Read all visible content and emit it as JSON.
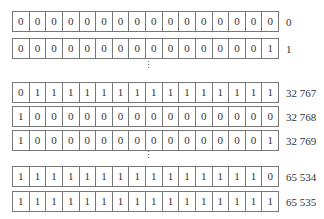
{
  "rows": [
    {
      "bits": [
        "0",
        "0",
        "0",
        "0",
        "0",
        "0",
        "0",
        "0",
        "0",
        "0",
        "0",
        "0",
        "0",
        "0",
        "0",
        "0"
      ],
      "value": "0"
    },
    {
      "bits": [
        "0",
        "0",
        "0",
        "0",
        "0",
        "0",
        "0",
        "0",
        "0",
        "0",
        "0",
        "0",
        "0",
        "0",
        "0",
        "1"
      ],
      "value": "1"
    },
    {
      "bits": [
        "0",
        "1",
        "1",
        "1",
        "1",
        "1",
        "1",
        "1",
        "1",
        "1",
        "1",
        "1",
        "1",
        "1",
        "1",
        "1"
      ],
      "value": "32 767"
    },
    {
      "bits": [
        "1",
        "0",
        "0",
        "0",
        "0",
        "0",
        "0",
        "0",
        "0",
        "0",
        "0",
        "0",
        "0",
        "0",
        "0",
        "0"
      ],
      "value": "32 768"
    },
    {
      "bits": [
        "1",
        "0",
        "0",
        "0",
        "0",
        "0",
        "0",
        "0",
        "0",
        "0",
        "0",
        "0",
        "0",
        "0",
        "0",
        "1"
      ],
      "value": "32 769"
    },
    {
      "bits": [
        "1",
        "1",
        "1",
        "1",
        "1",
        "1",
        "1",
        "1",
        "1",
        "1",
        "1",
        "1",
        "1",
        "1",
        "1",
        "0"
      ],
      "value": "65 534"
    },
    {
      "bits": [
        "1",
        "1",
        "1",
        "1",
        "1",
        "1",
        "1",
        "1",
        "1",
        "1",
        "1",
        "1",
        "1",
        "1",
        "1",
        "1"
      ],
      "value": "65 535"
    }
  ],
  "ellipsis": "⋮"
}
